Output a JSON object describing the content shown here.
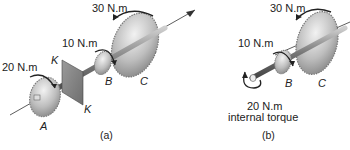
{
  "figure_a": {
    "torque_A": "20 N.m",
    "torque_B": "10 N.m",
    "torque_C": "30 N.m",
    "label_A": "A",
    "label_B": "B",
    "label_C": "C",
    "label_K_top": "K",
    "label_K_bottom": "K",
    "caption": "(a)"
  },
  "figure_b": {
    "torque_B": "10 N.m",
    "torque_C": "30 N.m",
    "internal_torque_value": "20 N.m",
    "internal_torque_label": "internal torque",
    "label_B": "B",
    "label_C": "C",
    "caption": "(b)"
  },
  "colors": {
    "gear_light": "#e6e6e6",
    "gear_dark": "#8c8c8c",
    "shaft": "#7a7a7a",
    "line": "#333333"
  }
}
